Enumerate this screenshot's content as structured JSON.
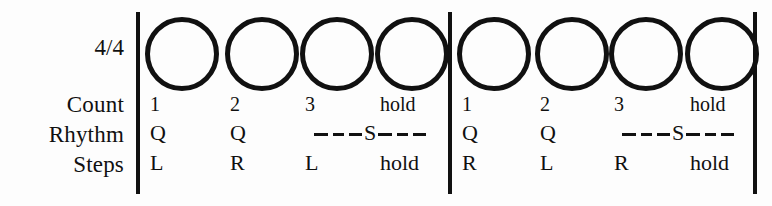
{
  "meter": {
    "label": "4/4"
  },
  "row_labels": {
    "count": "Count",
    "rhythm": "Rhythm",
    "steps": "Steps"
  },
  "colors": {
    "ink": "#111111",
    "paper": "#fdfdfd"
  },
  "measures": [
    {
      "name": "measure-1",
      "beats": [
        {
          "circle": true,
          "count": "1",
          "rhythm": "Q",
          "steps": "L"
        },
        {
          "circle": true,
          "count": "2",
          "rhythm": "Q",
          "steps": "R"
        },
        {
          "circle": true,
          "count": "3",
          "rhythm": "",
          "steps": "L"
        },
        {
          "circle": true,
          "count": "hold",
          "rhythm": "",
          "steps": "hold"
        }
      ],
      "slow_marker": {
        "letter": "S",
        "dash_left": "———",
        "dash_right": "———",
        "spans_beats": [
          3,
          4
        ]
      }
    },
    {
      "name": "measure-2",
      "beats": [
        {
          "circle": true,
          "count": "1",
          "rhythm": "Q",
          "steps": "R"
        },
        {
          "circle": true,
          "count": "2",
          "rhythm": "Q",
          "steps": "L"
        },
        {
          "circle": true,
          "count": "3",
          "rhythm": "",
          "steps": "R"
        },
        {
          "circle": true,
          "count": "hold",
          "rhythm": "",
          "steps": "hold"
        }
      ],
      "slow_marker": {
        "letter": "S",
        "dash_left": "———",
        "dash_right": "———",
        "spans_beats": [
          3,
          4
        ]
      }
    }
  ]
}
